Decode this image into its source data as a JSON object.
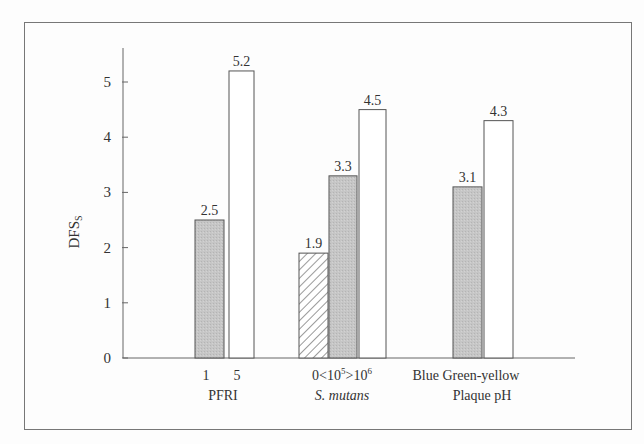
{
  "chart_data": {
    "type": "bar",
    "title": "",
    "ylabel": "DFSs",
    "ylabel_main": "DFS",
    "ylabel_sub": "S",
    "ylim": [
      0,
      5.5
    ],
    "yticks": [
      "0",
      "1",
      "2",
      "3",
      "4",
      "5"
    ],
    "grid": false,
    "legend": "none",
    "groups": [
      {
        "name": "PFRI",
        "italic": false,
        "bars": [
          {
            "category": "1",
            "value": 2.5,
            "label": "2.5",
            "fill": "gray"
          },
          {
            "category": "5",
            "value": 5.2,
            "label": "5.2",
            "fill": "white"
          }
        ],
        "tick_label": "1   5"
      },
      {
        "name": "S. mutans",
        "italic": true,
        "bars": [
          {
            "category": "0",
            "value": 1.9,
            "label": "1.9",
            "fill": "hatched"
          },
          {
            "category": "<10^5",
            "value": 3.3,
            "label": "3.3",
            "fill": "gray"
          },
          {
            "category": ">10^6",
            "value": 4.5,
            "label": "4.5",
            "fill": "white"
          }
        ],
        "tick_label": "0<10⁵>10⁶"
      },
      {
        "name": "Plaque pH",
        "italic": false,
        "bars": [
          {
            "category": "Blue",
            "value": 3.1,
            "label": "3.1",
            "fill": "gray"
          },
          {
            "category": "Green-yellow",
            "value": 4.3,
            "label": "4.3",
            "fill": "white"
          }
        ],
        "tick_label": "Blue Green-yellow"
      }
    ]
  },
  "colors": {
    "gray_fill": "#c4c4c4",
    "outline": "#555555",
    "axis": "#666666"
  }
}
